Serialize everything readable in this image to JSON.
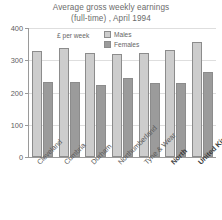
{
  "chart_data": {
    "type": "bar",
    "title": "Average gross weekly earnings (full-time) , April 1994",
    "title_line1": "Average gross weekly earnings",
    "title_line2": "(full-time) , April 1994",
    "xlabel": "",
    "ylabel": "£ per week",
    "ylim": [
      0,
      400
    ],
    "yticks": [
      0,
      100,
      200,
      300,
      400
    ],
    "ytick_labels": [
      "0",
      "100",
      "200",
      "300",
      "400"
    ],
    "grid": true,
    "legend_position": "upper-center-inside",
    "categories": [
      "Cleveland",
      "Cumbria",
      "Durham",
      "Northumberland",
      "Tyne & Wear",
      "North",
      "United Kingdom"
    ],
    "emphasized_categories": [
      "North",
      "United Kingdom"
    ],
    "series": [
      {
        "name": "Males",
        "color": "#cdcdcd",
        "values": [
          330,
          338,
          322,
          318,
          322,
          331,
          357
        ]
      },
      {
        "name": "Females",
        "color": "#9b9b9b",
        "values": [
          232,
          233,
          222,
          245,
          230,
          231,
          263
        ]
      }
    ]
  },
  "legend": {
    "unit_note": "£ per week",
    "entries": [
      {
        "label": "Males",
        "swatch": "males"
      },
      {
        "label": "Females",
        "swatch": "females"
      }
    ]
  }
}
